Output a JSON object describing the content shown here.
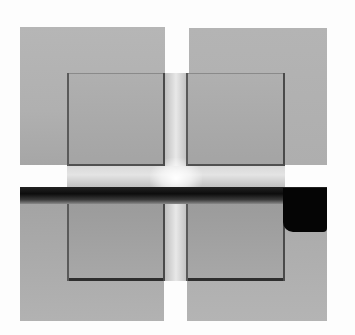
{
  "image": {
    "description": "Grayscale photograph of four overlapping gray squares forming a cross-shaped white gap with a dark horizontal band",
    "colors": {
      "background": "#fdfdfd",
      "outer_square": "#b0b0b0",
      "inner_square": "#a8a8a8",
      "inner_border": "#4a4a4a",
      "central_strip": "#e0e0e0",
      "dark_band": "#0c0c0c"
    }
  }
}
